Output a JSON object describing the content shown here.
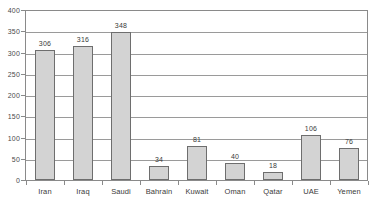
{
  "chart_data": {
    "type": "bar",
    "title": "",
    "subtitle": "",
    "xlabel": "",
    "ylabel": "",
    "ylim": [
      0,
      400
    ],
    "ytick_step": 50,
    "yticks": [
      0,
      50,
      100,
      150,
      200,
      250,
      300,
      350,
      400
    ],
    "grid": true,
    "legend": false,
    "legend_position": "none",
    "categories": [
      "Iran",
      "Iraq",
      "Saudi",
      "Bahrain",
      "Kuwait",
      "Oman",
      "Qatar",
      "UAE",
      "Yemen"
    ],
    "values": [
      306,
      316,
      348,
      34,
      81,
      40,
      18,
      106,
      76
    ],
    "data_labels": [
      "306",
      "316",
      "348",
      "34",
      "81",
      "40",
      "18",
      "106",
      "76"
    ],
    "annotations": []
  },
  "style": {
    "bar_fill": "#d3d3d3",
    "bar_stroke": "#6e6e6e",
    "axis_color": "#8a8a8a",
    "grid_color": "#9a9a9a",
    "text_color": "#3a3a3a",
    "background": "#ffffff"
  }
}
